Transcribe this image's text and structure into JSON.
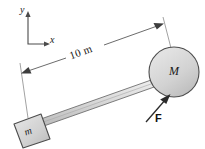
{
  "figure": {
    "type": "physics-free-body-diagram",
    "background_color": "#ffffff",
    "stroke_color": "#333333",
    "fill_gray": "#d0d0d0",
    "axes": {
      "name": "coordinate-axes",
      "y_label": "y",
      "x_label": "x",
      "origin_px": [
        28,
        44
      ],
      "y_tip_px": [
        28,
        12
      ],
      "x_tip_px": [
        48,
        44
      ]
    },
    "dimension": {
      "name": "length-dimension",
      "label": "10 m",
      "value": 10,
      "unit": "m",
      "start_px": [
        22,
        74
      ],
      "end_px": [
        162,
        24
      ],
      "double_headed": true
    },
    "sphere": {
      "name": "mass-M-sphere",
      "label": "M",
      "center_px": [
        174,
        72
      ],
      "radius_px": 25,
      "fill": "#d4d4d4"
    },
    "block": {
      "name": "mass-m-block",
      "label": "m",
      "center_px": [
        27,
        132
      ],
      "size_px": 28,
      "rotation_deg": -20,
      "fill": "#d4d4d4"
    },
    "rod": {
      "name": "connecting-rod",
      "from_px": [
        40,
        126
      ],
      "to_px": [
        152,
        86
      ],
      "fill": "#dcdcdc"
    },
    "force": {
      "name": "applied-force-F",
      "label": "F",
      "tail_px": [
        148,
        120
      ],
      "head_px": [
        170,
        95
      ],
      "direction": "up-right"
    }
  }
}
